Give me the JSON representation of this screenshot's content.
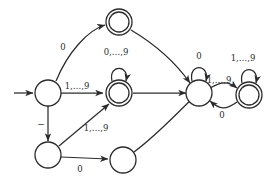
{
  "diagram": {
    "type": "state-transition-diagram",
    "stroke_color": "#2b2b2b",
    "background_color": "#ffffff",
    "states": [
      {
        "id": "q0",
        "name": "start-state",
        "cx": 48,
        "cy": 93,
        "r": 13,
        "accepting": false,
        "initial": true
      },
      {
        "id": "q1",
        "name": "state-top-accept",
        "cx": 119,
        "cy": 22,
        "r": 13,
        "accepting": true,
        "initial": false
      },
      {
        "id": "q2",
        "name": "state-mid-accept",
        "cx": 119,
        "cy": 93,
        "r": 13,
        "accepting": true,
        "initial": false
      },
      {
        "id": "q3",
        "name": "state-right",
        "cx": 199,
        "cy": 93,
        "r": 13,
        "accepting": false,
        "initial": false
      },
      {
        "id": "q4",
        "name": "state-far-right",
        "cx": 249,
        "cy": 95,
        "r": 13,
        "accepting": true,
        "initial": false
      },
      {
        "id": "q5",
        "name": "state-lower-left",
        "cx": 48,
        "cy": 155,
        "r": 13,
        "accepting": false,
        "initial": false
      },
      {
        "id": "q6",
        "name": "state-lower-right",
        "cx": 123,
        "cy": 160,
        "r": 13,
        "accepting": false,
        "initial": false
      }
    ],
    "edge_labels": {
      "q0_to_q1": "0",
      "q0_to_q2": "1,…,9",
      "q1_self_or_down": "0,…,9",
      "q2_self": "0,…,9",
      "q0_to_q5": "−",
      "q5_to_q2": "1,…,9",
      "q5_to_q6": "0",
      "q3_self": "0",
      "q3_to_q4": "1,…,9",
      "q4_to_q3": "0",
      "q4_self": "1,…,9"
    }
  }
}
